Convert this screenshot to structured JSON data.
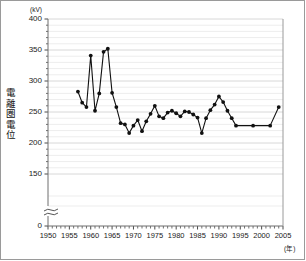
{
  "chart_data": {
    "type": "line",
    "title": "",
    "xlabel": "年",
    "ylabel": "電離圏電位",
    "yunit": "(kV)",
    "xunit": "(年)",
    "xlim": [
      1950,
      2005
    ],
    "ylim": [
      0,
      400
    ],
    "y_axis_break": true,
    "y_break_between": [
      0,
      150
    ],
    "grid": "horizontal",
    "legend": "none",
    "ytick_labels": [
      "400",
      "350",
      "300",
      "250",
      "200",
      "150",
      "0"
    ],
    "ytick_values": [
      400,
      350,
      300,
      250,
      200,
      150,
      0
    ],
    "yminor_step": 10,
    "xtick_labels": [
      "1950",
      "1955",
      "1960",
      "1965",
      "1970",
      "1975",
      "1980",
      "1985",
      "1990",
      "1995",
      "2000",
      "2005"
    ],
    "xtick_values": [
      1950,
      1955,
      1960,
      1965,
      1970,
      1975,
      1980,
      1985,
      1990,
      1995,
      2000,
      2005
    ],
    "xminor_step": 1,
    "marker": "filled-circle",
    "line_color": "#111111",
    "marker_color": "#111111",
    "x": [
      1957,
      1958,
      1959,
      1960,
      1961,
      1962,
      1963,
      1964,
      1965,
      1966,
      1967,
      1968,
      1969,
      1970,
      1971,
      1972,
      1973,
      1974,
      1975,
      1976,
      1977,
      1978,
      1979,
      1980,
      1981,
      1982,
      1983,
      1984,
      1985,
      1986,
      1987,
      1988,
      1989,
      1990,
      1991,
      1992,
      1993,
      1994,
      1998,
      2002,
      2004
    ],
    "values": [
      283,
      265,
      258,
      341,
      252,
      280,
      347,
      352,
      281,
      258,
      232,
      230,
      216,
      228,
      237,
      219,
      235,
      247,
      260,
      243,
      240,
      249,
      252,
      248,
      243,
      251,
      250,
      246,
      241,
      216,
      240,
      253,
      262,
      275,
      266,
      252,
      240,
      228,
      228,
      228,
      258
    ]
  }
}
